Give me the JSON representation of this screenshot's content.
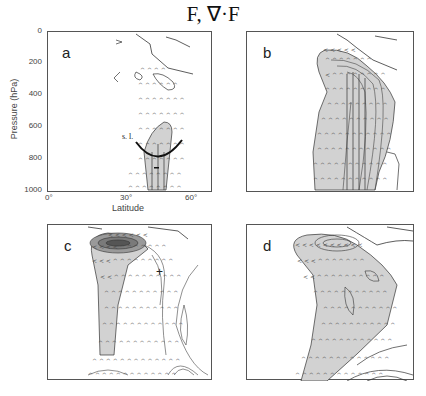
{
  "figure": {
    "title": "F, ∇·F",
    "panels": [
      {
        "id": "a",
        "label": "a"
      },
      {
        "id": "b",
        "label": "b"
      },
      {
        "id": "c",
        "label": "c"
      },
      {
        "id": "d",
        "label": "d"
      }
    ],
    "axes": {
      "ylabel": "Pressure (hPa)",
      "yticks": [
        "0",
        "200",
        "400",
        "600",
        "800",
        "1000"
      ],
      "xlabel": "Latitude",
      "xticks": [
        "0°",
        "30°",
        "60°"
      ]
    },
    "annotations": {
      "sl_label": "s. l.",
      "minus_sign": "−",
      "plus_sign": "+"
    },
    "colors": {
      "shading": "#d2d2d2",
      "contour": "#333333",
      "frame": "#555555"
    }
  }
}
